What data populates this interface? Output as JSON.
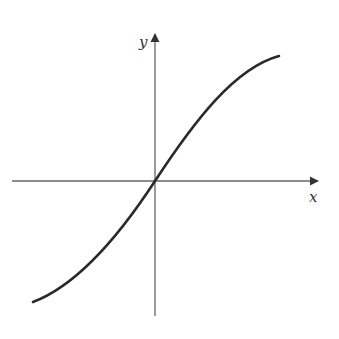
{
  "figure": {
    "x_axis_label": "x",
    "y_axis_label": "y",
    "colors": {
      "curve": "#2a2a2a",
      "axes": "#666666",
      "labels": "#333333",
      "background": "#ffffff"
    },
    "axes": {
      "x_axis": {
        "x1": 12,
        "y1": 181,
        "x2": 318,
        "y2": 181
      },
      "y_axis": {
        "x1": 155,
        "y1": 316,
        "x2": 155,
        "y2": 34
      }
    },
    "curve_path": "M 33 302 C 70 288, 110 250, 155 181 C 195 120, 235 68, 279 56",
    "label_positions": {
      "x": {
        "x": 309,
        "y": 202
      },
      "y": {
        "x": 139,
        "y": 47
      }
    }
  }
}
